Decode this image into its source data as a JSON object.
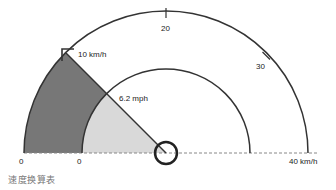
{
  "diagram": {
    "title": "速度换算表",
    "outer_scale": {
      "unit": "km/h",
      "ticks": [
        {
          "label": "0"
        },
        {
          "label": "10 km/h"
        },
        {
          "label": "20"
        },
        {
          "label": "30"
        },
        {
          "label": "40 km/h"
        }
      ]
    },
    "inner_scale": {
      "unit": "mph",
      "ticks": [
        {
          "label": "0"
        },
        {
          "label": "6.2 mph"
        }
      ]
    },
    "needle_value": "10 km/h",
    "colors": {
      "outer_fill": "#777777",
      "inner_fill": "#d9d9d9",
      "stroke": "#333333",
      "baseline": "#888888"
    }
  }
}
